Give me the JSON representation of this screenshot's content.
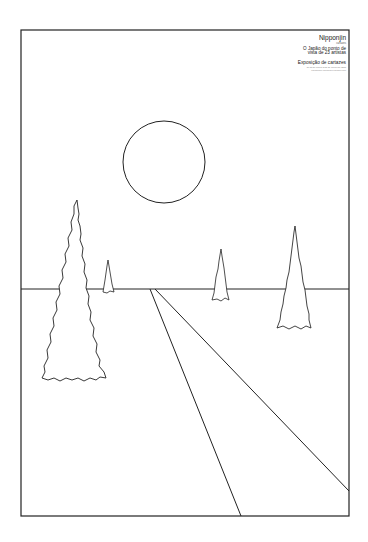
{
  "poster": {
    "title": "Nipponjin",
    "subtitle": "cartazes",
    "description_line1": "O Japão do ponto de",
    "description_line2": "vista de 23 artistas",
    "event": "Exposição de cartazes",
    "fine_print_line1": "de 00 de xxxxxx a 00 de xxxxxx de 0000",
    "fine_print_line2": "xxxxxxxxxx xxxxxxxxx xxxxxxx xxxx"
  },
  "artwork": {
    "stroke_color": "#222222",
    "background_color": "#ffffff",
    "frame": {
      "x": 21,
      "y": 30,
      "width": 328,
      "height": 486
    },
    "sun": {
      "cx": 164,
      "cy": 162,
      "r": 41
    },
    "horizon_y": 289,
    "road_lines": [
      {
        "x1": 150,
        "y1": 289,
        "x2": 241,
        "y2": 516
      },
      {
        "x1": 155,
        "y1": 289,
        "x2": 349,
        "y2": 491
      }
    ],
    "trees": [
      {
        "name": "large-left-tree",
        "apex": [
          77,
          200
        ],
        "base_left": 42,
        "base_right": 106,
        "base_y": 378
      },
      {
        "name": "small-far-tree",
        "apex": [
          108,
          260
        ],
        "base_left": 103,
        "base_right": 114,
        "base_y": 292
      },
      {
        "name": "middle-tree",
        "apex": [
          221,
          249
        ],
        "base_left": 212,
        "base_right": 229,
        "base_y": 300
      },
      {
        "name": "right-tree",
        "apex": [
          295,
          226
        ],
        "base_left": 277,
        "base_right": 311,
        "base_y": 328
      }
    ]
  }
}
